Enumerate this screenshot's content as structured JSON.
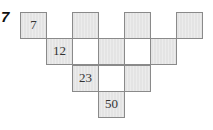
{
  "problem": {
    "number": "7"
  },
  "colors": {
    "shaded_fill": "#e6e6e6",
    "white_fill": "#ffffff",
    "border": "#8a8a8a",
    "text": "#333333"
  },
  "pyramid": {
    "description": "Inverted number pyramid with alternating shaded/white cells",
    "rows": [
      {
        "cells": [
          {
            "col": 0,
            "value": "7",
            "shaded": true
          },
          {
            "col": 2,
            "value": "",
            "shaded": true
          },
          {
            "col": 4,
            "value": "",
            "shaded": true
          },
          {
            "col": 6,
            "value": "",
            "shaded": true
          }
        ]
      },
      {
        "cells": [
          {
            "col": 1,
            "value": "12",
            "shaded": true
          },
          {
            "col": 2,
            "value": "",
            "shaded": false
          },
          {
            "col": 3,
            "value": "",
            "shaded": true
          },
          {
            "col": 4,
            "value": "",
            "shaded": false
          },
          {
            "col": 5,
            "value": "",
            "shaded": true
          }
        ]
      },
      {
        "cells": [
          {
            "col": 2,
            "value": "23",
            "shaded": true
          },
          {
            "col": 3,
            "value": "",
            "shaded": false
          },
          {
            "col": 4,
            "value": "",
            "shaded": true
          }
        ]
      },
      {
        "cells": [
          {
            "col": 3,
            "value": "50",
            "shaded": true
          }
        ]
      }
    ]
  }
}
